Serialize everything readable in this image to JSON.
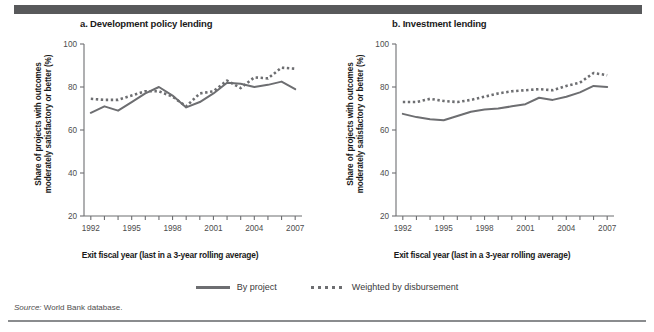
{
  "figure": {
    "source_prefix": "Source:",
    "source_text": "World Bank database."
  },
  "legend": {
    "position": "bottom-center",
    "items": [
      {
        "label": "By project",
        "style": "solid",
        "color": "#6d6e71"
      },
      {
        "label": "Weighted by disbursement",
        "style": "dotted",
        "color": "#6d6e71"
      }
    ]
  },
  "panels": [
    {
      "id": "a",
      "title": "a. Development policy lending",
      "ylabel": "Share of projects with outcomes moderately satisfactory or better (%)",
      "xlabel": "Exit fiscal year (last in a 3-year rolling average)"
    },
    {
      "id": "b",
      "title": "b. Investment lending",
      "ylabel": "Share of projects with outcomes moderately satisfactory or better (%)",
      "xlabel": "Exit fiscal year (last in a 3-year rolling average)"
    }
  ],
  "chart_data": [
    {
      "type": "line",
      "title": "a. Development policy lending",
      "xlabel": "Exit fiscal year (last in a 3-year rolling average)",
      "ylabel": "Share of projects with outcomes moderately satisfactory or better (%)",
      "x": [
        1992,
        1993,
        1994,
        1995,
        1996,
        1997,
        1998,
        1999,
        2000,
        2001,
        2002,
        2003,
        2004,
        2005,
        2006,
        2007
      ],
      "xlim": [
        1991.5,
        2007.5
      ],
      "ylim": [
        20,
        100
      ],
      "yticks": [
        20,
        40,
        60,
        80,
        100
      ],
      "xticklabels": [
        "1992",
        "",
        "",
        "1995",
        "",
        "",
        "1998",
        "",
        "",
        "2001",
        "",
        "",
        "2004",
        "",
        "",
        "2007"
      ],
      "grid": false,
      "series": [
        {
          "name": "By project",
          "style": "solid",
          "color": "#6d6e71",
          "values": [
            68,
            71,
            69,
            73,
            77,
            80,
            76,
            70.5,
            73,
            77,
            82,
            81.5,
            80,
            81,
            82.5,
            79
          ]
        },
        {
          "name": "Weighted by disbursement",
          "style": "dotted",
          "color": "#6d6e71",
          "values": [
            74.5,
            74,
            74,
            76,
            78,
            78,
            75.5,
            71,
            77,
            78,
            83,
            79.5,
            84.5,
            84,
            89,
            88.5
          ]
        }
      ]
    },
    {
      "type": "line",
      "title": "b. Investment lending",
      "xlabel": "Exit fiscal year (last in a 3-year rolling average)",
      "ylabel": "Share of projects with outcomes moderately satisfactory or better (%)",
      "x": [
        1992,
        1993,
        1994,
        1995,
        1996,
        1997,
        1998,
        1999,
        2000,
        2001,
        2002,
        2003,
        2004,
        2005,
        2006,
        2007
      ],
      "xlim": [
        1991.5,
        2007.5
      ],
      "ylim": [
        20,
        100
      ],
      "yticks": [
        20,
        40,
        60,
        80,
        100
      ],
      "xticklabels": [
        "1992",
        "",
        "",
        "1995",
        "",
        "",
        "1998",
        "",
        "",
        "2001",
        "",
        "",
        "2004",
        "",
        "",
        "2007"
      ],
      "grid": false,
      "series": [
        {
          "name": "By project",
          "style": "solid",
          "color": "#6d6e71",
          "values": [
            67.5,
            66,
            65,
            64.5,
            66.5,
            68.5,
            69.5,
            70,
            71,
            72,
            75,
            74,
            75.5,
            77.5,
            80.5,
            80
          ]
        },
        {
          "name": "Weighted by disbursement",
          "style": "dotted",
          "color": "#6d6e71",
          "values": [
            73,
            73,
            74.5,
            73.5,
            73,
            74,
            75.5,
            77,
            78,
            78.5,
            79,
            78.5,
            80.5,
            82,
            86.5,
            85.5
          ]
        }
      ]
    }
  ]
}
